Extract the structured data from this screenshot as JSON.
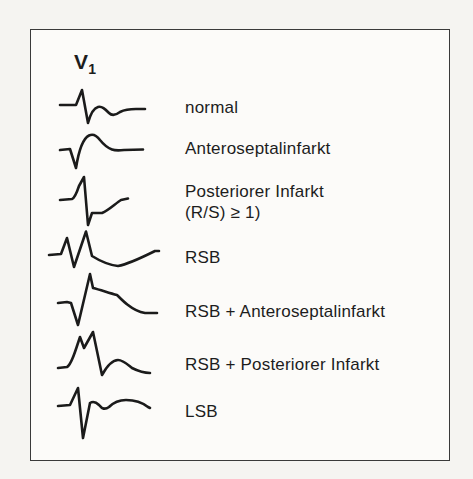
{
  "lead": {
    "base": "V",
    "sub": "1"
  },
  "rows": [
    {
      "name": "normal",
      "label": "normal",
      "path": "M 1,20 L 17,20 L 23,5 L 29,38 C 32,27 35,23 39,22 C 43,21 46,24 50,28 C 53,31 57,30 61,27 C 65,25 71,24 77,24 L 86,24"
    },
    {
      "name": "anteroseptalinfarkt",
      "label": "Anteroseptalinfarkt",
      "path": "M 2,20 L 12,19 L 18,38 C 21,19 26,8 31,5.5 C 35,3.5 39,6 42,10 C 46,15 50,18 54,19.5 C 58,21 62,20.5 66,20 L 85,19.5"
    },
    {
      "name": "posteriorer-infarkt",
      "label": "Posteriorer Infarkt",
      "label2": "(R/S) ≥ 1)",
      "path": "M 1,24 L 13,23 C 16,22 18,16 20,10 L 25,1 L 29,49 L 33,37 L 43,37 C 50,34 57,27 62,24 L 69,22.5"
    },
    {
      "name": "rsb",
      "label": "RSB",
      "path": "M 1,26 L 13,25 L 19,9 L 26,38 L 38,2.5 L 44,27 C 52,32 61,36 70,37 C 81,35 95,28 107,22 L 111,22"
    },
    {
      "name": "rsb-anteroseptalinfarkt",
      "label": "RSB + Anteroseptalinfarkt",
      "path": "M 1,31 L 10,30 L 14,31 L 21,53 L 33,2 L 36,16 C 44,18 52,21 60,23 C 64,27 68,31 71,33 C 76,37 82,40 88,41 L 100,41"
    },
    {
      "name": "rsb-posteriorer-infarkt",
      "label": "RSB + Posteriorer Infarkt",
      "path": "M 1,38 L 10,37 C 14,35 17,25 20,16 L 23,7 L 27,18 L 36,2 L 45,45 C 50,36 56,30 61,30 C 66,30 70,34 75,38 C 81,41 88,43 93,43"
    },
    {
      "name": "lsb",
      "label": "LSB",
      "path": "M 1,20 L 13,19 L 21,2 L 26,52 L 33,17 C 36,15 39,16 42,19 C 45,23 48,24 52,21 C 57,16 63,14 69,14 C 77,14 86,17 91,21 L 93,22"
    }
  ],
  "colors": {
    "trace": "#1b1b1b",
    "text": "#1d1d1d",
    "frame_border": "#3a3a3a",
    "paper": "#f5f4f1",
    "panel": "#fcfbf9"
  }
}
